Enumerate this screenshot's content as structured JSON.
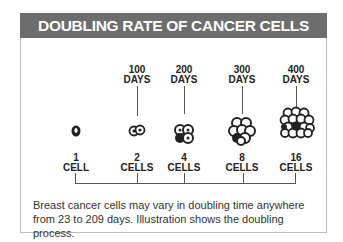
{
  "title": "DOUBLING RATE OF CANCER CELLS",
  "stages": [
    {
      "count": "1",
      "unit": "CELL",
      "days": "",
      "days_unit": ""
    },
    {
      "count": "2",
      "unit": "CELLS",
      "days": "100",
      "days_unit": "DAYS"
    },
    {
      "count": "4",
      "unit": "CELLS",
      "days": "200",
      "days_unit": "DAYS"
    },
    {
      "count": "8",
      "unit": "CELLS",
      "days": "300",
      "days_unit": "DAYS"
    },
    {
      "count": "16",
      "unit": "CELLS",
      "days": "400",
      "days_unit": "DAYS"
    }
  ],
  "caption": "Breast cancer cells may vary in doubling time anywhere from 23 to 209 days. Illustration shows the doubling process.",
  "colors": {
    "header_bg": "#6d6d6d",
    "header_text": "#ffffff"
  }
}
